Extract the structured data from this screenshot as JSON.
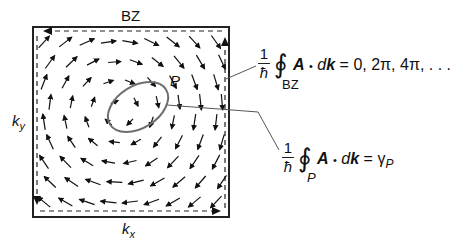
{
  "figure": {
    "region_label": "BZ",
    "kx_label": "k",
    "kx_sub": "x",
    "ky_label": "k",
    "ky_sub": "y",
    "path_label": "P",
    "colors": {
      "ink": "#111111",
      "ellipse": "#6e6e6e",
      "connector": "#555555"
    },
    "vector_field": {
      "description": "Vortex-like Berry connection field A(k) circulating counterclockwise around a center inside path P",
      "center": [
        0.42,
        0.43
      ],
      "grid_cols": 9,
      "grid_rows": 9,
      "sense": "counterclockwise"
    },
    "boundary_arrows": [
      "left-edge-down",
      "bottom-edge-right",
      "right-edge-up",
      "top-edge-left"
    ]
  },
  "equations": {
    "bz": {
      "frac_num": "1",
      "frac_den": "ħ",
      "integral": "∮",
      "integrand_A": "A",
      "dot": "•",
      "integrand_d": "d",
      "integrand_k": "k",
      "rhs": "= 0, 2π, 4π, . . .",
      "subscript": "BZ"
    },
    "path": {
      "frac_num": "1",
      "frac_den": "ħ",
      "integral": "∮",
      "integrand_A": "A",
      "dot": "•",
      "integrand_d": "d",
      "integrand_k": "k",
      "rhs_eq": "= γ",
      "rhs_sub": "P",
      "subscript": "P"
    }
  }
}
